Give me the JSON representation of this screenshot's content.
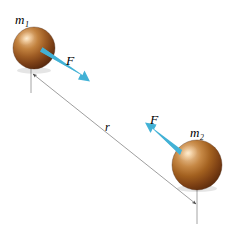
{
  "figure": {
    "background_color": "#ffffff",
    "width": 230,
    "height": 233
  },
  "labels": {
    "mass1": {
      "symbol": "m",
      "subscript": "1",
      "text": "m₁"
    },
    "mass2": {
      "symbol": "m",
      "subscript": "2",
      "text": "m₂"
    },
    "force1": {
      "text": "F"
    },
    "force2": {
      "text": "F"
    },
    "separation": {
      "text": "r"
    }
  },
  "colors": {
    "force_arrow": "#45B4D8",
    "force_arrow_dark": "#3AA3C9",
    "sphere_highlight": "#E6B98A",
    "sphere_mid": "#B06A32",
    "sphere_dark": "#6E3A17",
    "sphere_edge": "#4A2410",
    "measure_line": "#8C8C8C",
    "drop_line": "#9A9A9A",
    "text": "#000000"
  },
  "spheres": [
    {
      "name": "mass-1-sphere",
      "cx": 34,
      "cy": 48,
      "r": 21
    },
    {
      "name": "mass-2-sphere",
      "cx": 197,
      "cy": 165,
      "r": 25
    }
  ],
  "force_arrows": [
    {
      "name": "force-arrow-mass-1",
      "direction": "down-right",
      "x1": 41,
      "y1": 52,
      "x2": 88,
      "y2": 79
    },
    {
      "name": "force-arrow-mass-2",
      "direction": "up-left",
      "x1": 181,
      "y1": 148,
      "x2": 148,
      "y2": 124
    }
  ],
  "separation_line": {
    "name": "separation-distance-line",
    "x1": 32,
    "y1": 74,
    "x2": 197,
    "y2": 205,
    "arrowheads": "both"
  },
  "drop_lines": [
    {
      "name": "drop-line-mass-1",
      "x": 31,
      "y1": 64,
      "y2": 92
    },
    {
      "name": "drop-line-mass-2",
      "x": 197,
      "y1": 186,
      "y2": 224
    }
  ]
}
